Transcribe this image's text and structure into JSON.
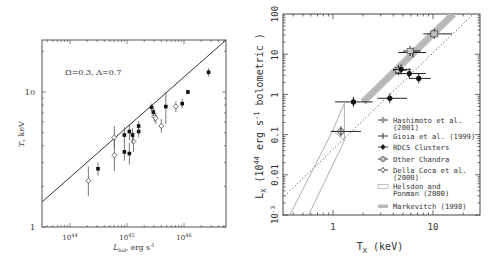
{
  "chart_data": [
    {
      "type": "scatter",
      "title": "",
      "annotation": "Ω=0.3,  Λ=0.7",
      "xlabel": "L_bol, erg s^-1",
      "ylabel": "T, keV",
      "xscale": "log",
      "yscale": "log",
      "xlim": [
        3.2e+43,
        5.5e+46
      ],
      "ylim": [
        1,
        24
      ],
      "xticks": [
        {
          "value": 1e+44,
          "label": "10^44"
        },
        {
          "value": 1e+45,
          "label": "10^45"
        },
        {
          "value": 1e+46,
          "label": "10^46"
        }
      ],
      "yticks": [
        {
          "value": 1,
          "label": "1"
        },
        {
          "value": 10,
          "label": "10"
        }
      ],
      "grid": false,
      "line": {
        "x": [
          3.2e+43,
          5.5e+46
        ],
        "y": [
          1.53,
          24
        ]
      },
      "series": [
        {
          "name": "open",
          "marker": "open-diamond",
          "points": [
            {
              "x": 2.1e+44,
              "T": 2.2,
              "lo": 1.7,
              "hi": 2.8
            },
            {
              "x": 6e+44,
              "T": 4.6,
              "lo": 3.8,
              "hi": 5.6
            },
            {
              "x": 6e+44,
              "T": 3.4,
              "lo": 2.6,
              "hi": 4.5
            },
            {
              "x": 1.3e+45,
              "T": 4.3,
              "lo": 3.6,
              "hi": 5.0
            },
            {
              "x": 3e+45,
              "T": 6.6,
              "lo": 6.0,
              "hi": 7.4
            },
            {
              "x": 3.2e+45,
              "T": 6.4,
              "lo": 5.8,
              "hi": 7.0
            },
            {
              "x": 4e+45,
              "T": 5.6,
              "lo": 5.0,
              "hi": 6.3
            },
            {
              "x": 7.2e+45,
              "T": 7.8,
              "lo": 7.1,
              "hi": 8.5
            }
          ]
        },
        {
          "name": "filled",
          "marker": "filled-square",
          "points": [
            {
              "x": 3.1e+44,
              "T": 2.7,
              "lo": 2.4,
              "hi": 3.0
            },
            {
              "x": 9e+44,
              "T": 4.8,
              "lo": 4.1,
              "hi": 5.5
            },
            {
              "x": 9e+44,
              "T": 3.6,
              "lo": 3.1,
              "hi": 4.1
            },
            {
              "x": 1.1e+45,
              "T": 5.1,
              "lo": 4.4,
              "hi": 5.8
            },
            {
              "x": 1.1e+45,
              "T": 3.5,
              "lo": 2.9,
              "hi": 4.2
            },
            {
              "x": 1.25e+45,
              "T": 4.8,
              "lo": 4.2,
              "hi": 5.4
            },
            {
              "x": 1.6e+45,
              "T": 5.1,
              "lo": 4.6,
              "hi": 5.6
            },
            {
              "x": 1.6e+45,
              "T": 5.6,
              "lo": 5.1,
              "hi": 6.1
            },
            {
              "x": 2.7e+45,
              "T": 7.7,
              "lo": 7.2,
              "hi": 8.2
            },
            {
              "x": 2.9e+45,
              "T": 7.1,
              "lo": 6.6,
              "hi": 7.6
            },
            {
              "x": 4.8e+45,
              "T": 7.8,
              "lo": 5.8,
              "hi": 10.0
            },
            {
              "x": 9.3e+45,
              "T": 8.2,
              "lo": 7.6,
              "hi": 8.9
            },
            {
              "x": 1.17e+46,
              "T": 10.0,
              "lo": 9.6,
              "hi": 10.4
            },
            {
              "x": 2.7e+46,
              "T": 14.0,
              "lo": 13.0,
              "hi": 15.0
            }
          ]
        }
      ]
    },
    {
      "type": "scatter",
      "title": "",
      "xlabel": "T_X (keV)",
      "ylabel": "L_X (10^44 erg s^-1 bolometric )",
      "xscale": "log",
      "yscale": "log",
      "xlim": [
        0.33,
        30
      ],
      "ylim": [
        0.001,
        100
      ],
      "xticks": [
        {
          "value": 1,
          "label": "1"
        },
        {
          "value": 10,
          "label": "10"
        }
      ],
      "yticks": [
        {
          "value": 100,
          "label": "100"
        },
        {
          "value": 10,
          "label": "10"
        },
        {
          "value": 1,
          "label": "1"
        },
        {
          "value": 0.1,
          "label": "0.1"
        },
        {
          "value": 0.01,
          "label": "0.01"
        },
        {
          "value": 0.001,
          "label": "10^-3"
        }
      ],
      "grid": false,
      "legend_position": "lower right",
      "legend": [
        {
          "label": "Hashimoto et al. (2001)",
          "line1": "Hashimoto et al.",
          "line2": "(2001)",
          "marker": "star-cross"
        },
        {
          "label": "Gioia et al. (1999)",
          "line1": "Gioia et al. (1999)",
          "line2": "",
          "marker": "cross"
        },
        {
          "label": "RDCS Clusters",
          "line1": "RDCS Clusters",
          "line2": "",
          "marker": "filled-circle"
        },
        {
          "label": "Other Chandra",
          "line1": "Other Chandra",
          "line2": "",
          "marker": "open-square"
        },
        {
          "label": "Della Ceca et al. (2000)",
          "line1": "Della Ceca et al.",
          "line2": "(2000)",
          "marker": "open-circle"
        },
        {
          "label": "Helsdon and Ponman (2000)",
          "line1": "Helsdon and",
          "line2": "Ponman (2000)",
          "marker": "open-box"
        },
        {
          "label": "Markevitch (1998)",
          "line1": "Markevitch (1998)",
          "line2": "",
          "marker": "gray-band"
        }
      ],
      "series": [
        {
          "name": "Hashimoto et al. (2001)",
          "points": [
            {
              "T": 10.3,
              "L": 32,
              "tlo": 8.0,
              "thi": 15.5
            }
          ]
        },
        {
          "name": "Gioia et al. (1999)",
          "points": [
            {
              "T": 6.3,
              "L": 11,
              "tlo": 4.5,
              "thi": 8.5
            }
          ]
        },
        {
          "name": "Other Chandra",
          "points": [
            {
              "T": 5.9,
              "L": 12,
              "tlo": 5.0,
              "thi": 7.5
            },
            {
              "T": 4.5,
              "L": 4.0,
              "tlo": 4.0,
              "thi": 5.5
            }
          ]
        },
        {
          "name": "RDCS Clusters",
          "points": [
            {
              "T": 4.8,
              "L": 4.2,
              "tlo": 4.0,
              "thi": 6.0
            },
            {
              "T": 5.8,
              "L": 3.3,
              "tlo": 4.2,
              "thi": 8.5
            },
            {
              "T": 7.2,
              "L": 2.5,
              "tlo": 5.8,
              "thi": 9.5
            },
            {
              "T": 3.7,
              "L": 0.8,
              "tlo": 2.8,
              "thi": 5.5
            },
            {
              "T": 1.6,
              "L": 0.65,
              "tlo": 1.05,
              "thi": 2.5
            }
          ]
        },
        {
          "name": "Della Ceca et al. (2000)",
          "points": [
            {
              "T": 1.2,
              "L": 0.12,
              "tlo": 0.95,
              "thi": 1.9
            }
          ]
        }
      ],
      "dotted_line": {
        "x": [
          0.33,
          30
        ],
        "y": [
          0.003,
          150
        ]
      },
      "markevitch_band": {
        "x": [
          2.0,
          16
        ],
        "y": [
          0.65,
          100
        ]
      }
    }
  ]
}
